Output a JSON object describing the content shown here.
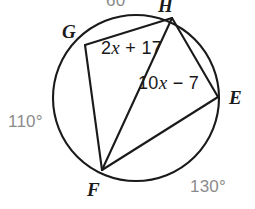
{
  "figure": {
    "kind": "circle-with-inscribed-quadrilateral",
    "stroke_color": "#1a1a1a",
    "fill_color": "#ffffff",
    "circle": {
      "cx": 136,
      "cy": 98,
      "r": 83
    },
    "vertices": [
      {
        "name": "G",
        "x": 85,
        "y": 45
      },
      {
        "name": "H",
        "x": 172,
        "y": 18
      },
      {
        "name": "E",
        "x": 218,
        "y": 97
      },
      {
        "name": "F",
        "x": 102,
        "y": 170
      }
    ],
    "chords": [
      {
        "from": "G",
        "to": "H"
      },
      {
        "from": "H",
        "to": "E"
      },
      {
        "from": "E",
        "to": "F"
      },
      {
        "from": "F",
        "to": "G"
      },
      {
        "from": "H",
        "to": "F"
      }
    ]
  },
  "vertex_labels": [
    {
      "id": "label-G",
      "text": "G"
    },
    {
      "id": "label-H",
      "text": "H"
    },
    {
      "id": "label-E",
      "text": "E"
    },
    {
      "id": "label-F",
      "text": "F"
    }
  ],
  "arc_measures": [
    {
      "id": "arc-GH",
      "text": "60",
      "position": "top",
      "clipped": true
    },
    {
      "id": "arc-GF",
      "text": "110°",
      "position": "left",
      "clipped": false
    },
    {
      "id": "arc-FE",
      "text": "130°",
      "position": "bottom-right",
      "clipped": false
    }
  ],
  "angle_expressions": [
    {
      "id": "expr-angle-GHF",
      "lead": "2",
      "variable": "x",
      "tail": " + 17",
      "full_text": "2x + 17"
    },
    {
      "id": "expr-angle-HFE",
      "lead": "10",
      "variable": "x",
      "tail": " − 7",
      "full_text": "10x − 7"
    }
  ],
  "colors": {
    "stroke": "#1a1a1a",
    "vertex_text": "#1b1b1b",
    "arc_text": "#8b8b8b",
    "expr_text": "#191919",
    "background": "#ffffff"
  }
}
